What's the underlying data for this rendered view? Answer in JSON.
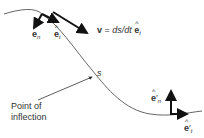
{
  "diagram": {
    "curve_color": "#555555",
    "arrow_color": "#111111",
    "labels": {
      "e_n": {
        "base": "e",
        "sub": "n"
      },
      "e_t": {
        "base": "e",
        "sub": "t"
      },
      "velocity": {
        "v": "v",
        "eq": " = ",
        "rhs": "ds/dt",
        "base": "e",
        "sub": "t"
      },
      "s": "s",
      "point_of_inflection": [
        "Point of",
        "inflection"
      ],
      "e_n_prime": {
        "base": "e",
        "prime": "′",
        "sub": "n"
      },
      "e_t_prime": {
        "base": "e",
        "prime": "′",
        "sub": "t"
      }
    }
  }
}
